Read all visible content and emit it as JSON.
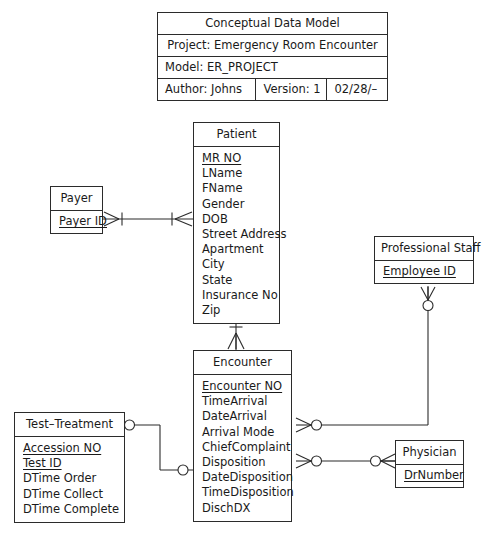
{
  "diagram": {
    "type": "entity-relationship-diagram",
    "notation": "crow's foot",
    "line_color": "#2b2b2b",
    "background_color": "#ffffff"
  },
  "title_block": {
    "title": "Conceptual Data Model",
    "project": "Project: Emergency Room Encounter",
    "model": "Model: ER_PROJECT",
    "author": "Author: Johns",
    "version": "Version: 1",
    "date": "02/28/–"
  },
  "entities": [
    {
      "id": "patient",
      "name": "Patient",
      "attributes": [
        {
          "label": "MR NO",
          "key": true
        },
        {
          "label": "LName",
          "key": false
        },
        {
          "label": "FName",
          "key": false
        },
        {
          "label": "Gender",
          "key": false
        },
        {
          "label": "DOB",
          "key": false
        },
        {
          "label": "Street Address",
          "key": false
        },
        {
          "label": "Apartment",
          "key": false
        },
        {
          "label": "City",
          "key": false
        },
        {
          "label": "State",
          "key": false
        },
        {
          "label": "Insurance No",
          "key": false
        },
        {
          "label": "Zip",
          "key": false
        }
      ]
    },
    {
      "id": "payer",
      "name": "Payer",
      "attributes": [
        {
          "label": "Payer ID",
          "key": true
        }
      ]
    },
    {
      "id": "professional_staff",
      "name": "Professional Staff",
      "attributes": [
        {
          "label": "Employee ID",
          "key": true
        }
      ]
    },
    {
      "id": "encounter",
      "name": "Encounter",
      "attributes": [
        {
          "label": "Encounter NO",
          "key": true
        },
        {
          "label": "TimeArrival",
          "key": false
        },
        {
          "label": "DateArrival",
          "key": false
        },
        {
          "label": "Arrival Mode",
          "key": false
        },
        {
          "label": "ChiefComplaint",
          "key": false
        },
        {
          "label": "Disposition",
          "key": false
        },
        {
          "label": "DateDisposition",
          "key": false
        },
        {
          "label": "TimeDisposition",
          "key": false
        },
        {
          "label": "DischDX",
          "key": false
        }
      ]
    },
    {
      "id": "test_treatment",
      "name": "Test–Treatment",
      "attributes": [
        {
          "label": "Accession NO",
          "key": true
        },
        {
          "label": "Test ID",
          "key": true
        },
        {
          "label": "DTime Order",
          "key": false
        },
        {
          "label": "DTime Collect",
          "key": false
        },
        {
          "label": "DTime Complete",
          "key": false
        }
      ]
    },
    {
      "id": "physician",
      "name": "Physician",
      "attributes": [
        {
          "label": "DrNumber",
          "key": true
        }
      ]
    }
  ],
  "relationships": [
    {
      "id": "payer-patient",
      "from": "payer",
      "to": "patient",
      "from_cardinality": "one-or-many",
      "to_cardinality": "one-or-many"
    },
    {
      "id": "patient-encounter",
      "from": "patient",
      "to": "encounter",
      "from_cardinality": "one-and-only-one",
      "to_cardinality": "one-or-many"
    },
    {
      "id": "staff-encounter",
      "from": "professional_staff",
      "to": "encounter",
      "from_cardinality": "zero-or-many",
      "to_cardinality": "zero-or-many"
    },
    {
      "id": "test-encounter",
      "from": "test_treatment",
      "to": "encounter",
      "from_cardinality": "zero-or-many",
      "to_cardinality": "zero-or-many"
    },
    {
      "id": "encounter-physician",
      "from": "encounter",
      "to": "physician",
      "from_cardinality": "zero-or-many",
      "to_cardinality": "zero-or-many"
    }
  ]
}
